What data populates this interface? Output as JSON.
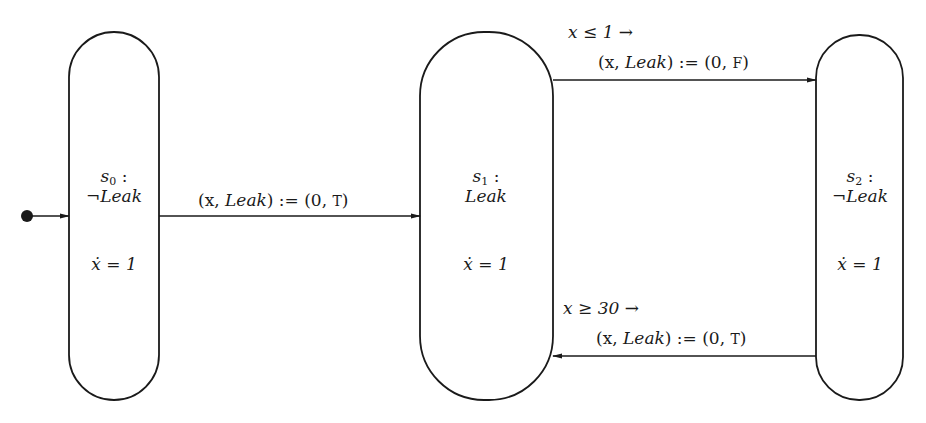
{
  "diagram": {
    "type": "hybrid automaton (state transition diagram)",
    "initial_marker": "filled-dot",
    "states": [
      {
        "id": "s0",
        "name": "s",
        "sub": "0",
        "name_suffix": " :",
        "invariant_prefix": "¬",
        "invariant": "Leak",
        "flow": "ẋ = 1"
      },
      {
        "id": "s1",
        "name": "s",
        "sub": "1",
        "name_suffix": " :",
        "invariant_prefix": "",
        "invariant": "Leak",
        "flow": "ẋ = 1"
      },
      {
        "id": "s2",
        "name": "s",
        "sub": "2",
        "name_suffix": " :",
        "invariant_prefix": "¬",
        "invariant": "Leak",
        "flow": "ẋ = 1"
      }
    ],
    "transitions": [
      {
        "from": "s0",
        "to": "s1",
        "guard": "",
        "assign_lhs_a": "(x, ",
        "assign_lhs_b": "Leak",
        "assign_rhs": ") := (0, ",
        "value": "T",
        "close": ")"
      },
      {
        "from": "s1",
        "to": "s2",
        "guard": "x ≤ 1  →",
        "assign_lhs_a": "(x, ",
        "assign_lhs_b": "Leak",
        "assign_rhs": ") := (0, ",
        "value": "F",
        "close": ")"
      },
      {
        "from": "s2",
        "to": "s1",
        "guard": "x ≥ 30  →",
        "assign_lhs_a": "(x, ",
        "assign_lhs_b": "Leak",
        "assign_rhs": ") := (0, ",
        "value": "T",
        "close": ")"
      }
    ],
    "colors": {
      "stroke": "#1a1a1a",
      "background": "#ffffff"
    }
  }
}
